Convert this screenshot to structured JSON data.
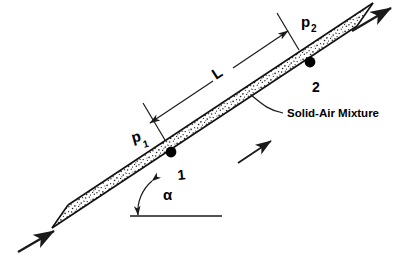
{
  "figure": {
    "background_color": "#ffffff",
    "line_color": "#1a1a1a",
    "text_color": "#000000"
  },
  "labels": {
    "pressure_1": "p",
    "pressure_1_sub": "1",
    "pressure_2": "p",
    "pressure_2_sub": "2",
    "length": "L",
    "angle": "α",
    "station_1": "1",
    "station_2": "2",
    "mixture": "Solid-Air Mixture"
  },
  "geometry": {
    "pipe_angle_degrees": 30,
    "pipe_lower_left": [
      52,
      228
    ],
    "pipe_upper_right": [
      357,
      26
    ],
    "pipe_width_px": 22,
    "horizontal_reference_start": [
      130,
      216
    ],
    "horizontal_reference_end": [
      222,
      216
    ],
    "station_1_point": [
      171,
      152
    ],
    "station_2_point": [
      310,
      62
    ],
    "dimension_L_start": [
      146,
      126
    ],
    "dimension_L_end": [
      285,
      36
    ]
  },
  "annotations": {
    "inlet_arrow": "flow-in-arrow",
    "outlet_arrow": "flow-out-arrow",
    "mid_flow_arrow": "flow-direction-arrow",
    "angle_arc": "angle-arc",
    "mixture_leader": "mixture-leader-line"
  }
}
